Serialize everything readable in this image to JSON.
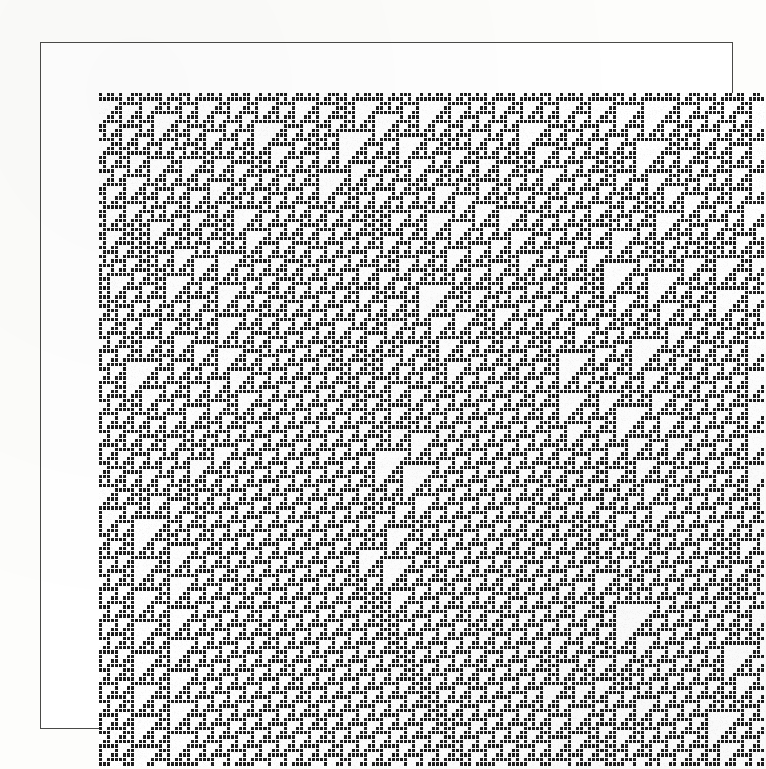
{
  "figure": {
    "name": "cellular-automaton-space-time-diagram",
    "caption": "",
    "background_color": "#fdfdfb",
    "plate_background_color": "#ffffff",
    "frame_color": "#4a4a48",
    "cell_on_color": "#1a1a1a",
    "cell_off_color": "#ffffff"
  },
  "plate": {
    "frame_left": 40,
    "frame_top": 42,
    "frame_width": 693,
    "frame_height": 687,
    "frame_border_px": 1
  },
  "chart_data": {
    "type": "heatmap",
    "title": "",
    "subtitle": "",
    "xlabel": "",
    "ylabel": "",
    "legend": [],
    "grid": false,
    "automaton": {
      "rule_number": 110,
      "rule_binary": "01101110",
      "neighborhood": 3,
      "states": 2,
      "state_labels": [
        "0",
        "1"
      ],
      "boundary": "periodic",
      "initial_condition": "random",
      "time_direction": "top-to-bottom"
    },
    "grid_geometry": {
      "columns": 166,
      "rows": 150,
      "cell_width_px": 4.012,
      "cell_height_px": 4.493,
      "origin_x_px": 58,
      "origin_y_px": 50,
      "canvas_width_px": 666,
      "canvas_height_px": 674
    },
    "axis_ranges": {
      "x": [
        0,
        166
      ],
      "y": [
        0,
        150
      ]
    },
    "rule_table": [
      {
        "neighborhood": "111",
        "output": 0
      },
      {
        "neighborhood": "110",
        "output": 1
      },
      {
        "neighborhood": "101",
        "output": 1
      },
      {
        "neighborhood": "100",
        "output": 0
      },
      {
        "neighborhood": "011",
        "output": 1
      },
      {
        "neighborhood": "010",
        "output": 1
      },
      {
        "neighborhood": "001",
        "output": 1
      },
      {
        "neighborhood": "000",
        "output": 0
      }
    ],
    "background_ether": {
      "description": "periodic Rule 110 ether background",
      "spatial_period": 14,
      "temporal_period": 7,
      "drift_cells_per_step": -2
    },
    "regions": [
      {
        "name": "random-seed-band",
        "description": "dense disordered band from the random initial row",
        "row_start": 0,
        "row_end": 18,
        "col_start": 0,
        "col_end": 166
      },
      {
        "name": "left-ether-domain",
        "description": "regular periodic background occupying the left side",
        "row_start": 14,
        "row_end": 150,
        "col_start": 0,
        "col_end": 70
      },
      {
        "name": "central-chaotic-wedge",
        "description": "structured/chaotic wedge narrowing toward the lower middle",
        "row_start": 0,
        "row_end": 132,
        "col_start": 36,
        "col_end": 130
      },
      {
        "name": "right-ether-domain",
        "description": "regular periodic background occupying the right side",
        "row_start": 46,
        "row_end": 150,
        "col_start": 120,
        "col_end": 166
      },
      {
        "name": "wedge-apex",
        "description": "convergence point where the chaotic wedge collapses",
        "row_start": 128,
        "row_end": 136,
        "col_start": 108,
        "col_end": 118
      }
    ],
    "glider_boundaries": [
      {
        "name": "left-wedge-edge",
        "slope_cols_per_row": 0.62,
        "col_at_row_0": 36,
        "col_at_row_132": 118
      },
      {
        "name": "right-wedge-edge",
        "slope_cols_per_row": -0.36,
        "col_at_row_0": 166,
        "col_at_row_132": 118
      },
      {
        "name": "upper-left-glider-fan",
        "slope_cols_per_row": 0.8,
        "col_at_row_0": 4,
        "col_at_row_60": 52
      }
    ],
    "seed_row": [
      1,
      0,
      1,
      1,
      0,
      1,
      0,
      0,
      1,
      1,
      1,
      0,
      1,
      0,
      1,
      1,
      0,
      0,
      1,
      0,
      1,
      1,
      1,
      0,
      0,
      1,
      0,
      1,
      1,
      0,
      1,
      0,
      0,
      1,
      1,
      0,
      1,
      1,
      0,
      0,
      1,
      0,
      1,
      0,
      1,
      1,
      1,
      0,
      0,
      1,
      1,
      0,
      1,
      0,
      1,
      0,
      0,
      1,
      1,
      1,
      0,
      1,
      0,
      0,
      1,
      0,
      1,
      1,
      0,
      1,
      1,
      0,
      0,
      1,
      0,
      1,
      1,
      1,
      0,
      0,
      1,
      0,
      1,
      0,
      1,
      1,
      0,
      1,
      0,
      0,
      1,
      1,
      1,
      0,
      1,
      0,
      1,
      0,
      0,
      1,
      1,
      0,
      1,
      1,
      0,
      0,
      1,
      0,
      1,
      0,
      1,
      1,
      1,
      0,
      0,
      1,
      0,
      1,
      1,
      0,
      1,
      0,
      0,
      1,
      1,
      0,
      1,
      0,
      1,
      1,
      1,
      0,
      0,
      1,
      0,
      0,
      1,
      1,
      0,
      1,
      0,
      1,
      1,
      0,
      1,
      0,
      0,
      1,
      1,
      1,
      0,
      1,
      0,
      1,
      0,
      0,
      1,
      1,
      0,
      1,
      1,
      0,
      0,
      1,
      1,
      0,
      1,
      0,
      1,
      1,
      0,
      0,
      1,
      0
    ]
  },
  "accessibility": {
    "alt": "Black and white space-time diagram of a one-dimensional two-state cellular automaton. A random initial row at the top evolves downward, producing a regular striped background interrupted by a chaotic triangular wedge that narrows to a point near the bottom centre-right."
  }
}
